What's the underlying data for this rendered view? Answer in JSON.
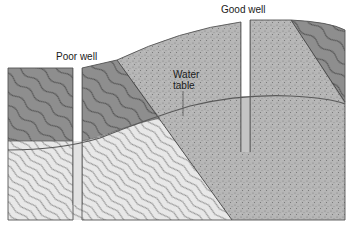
{
  "diagram": {
    "labels": {
      "poor_well": "Poor well",
      "good_well": "Good well",
      "water_table_line1": "Water",
      "water_table_line2": "table"
    },
    "layers": [
      {
        "name": "dark-shale-upper-left",
        "fill": "#8e8e8e"
      },
      {
        "name": "light-rock-lower-left",
        "fill": "#e6e6e6"
      },
      {
        "name": "sandstone-aquifer",
        "fill": "#b4b4b4"
      },
      {
        "name": "dark-shale-upper-right",
        "fill": "#8a8a8a"
      }
    ],
    "colors": {
      "outline": "#555555",
      "water_table_line": "#5a5a5a",
      "saturated_well": "#c8c8c8",
      "dry_well": "#ffffff"
    }
  }
}
